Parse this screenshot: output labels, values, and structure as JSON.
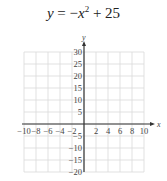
{
  "title_parts": {
    "lhs": "y",
    "eq": " = −",
    "x": "x",
    "sup": "2",
    "rest": " + 25"
  },
  "chart_data": {
    "type": "line",
    "xlabel": "x",
    "ylabel": "y",
    "xlim": [
      -10,
      10
    ],
    "ylim": [
      -20,
      30
    ],
    "grid": true,
    "xticks": [
      -10,
      -8,
      -6,
      -4,
      -2,
      2,
      4,
      6,
      8,
      10
    ],
    "yticks": [
      -20,
      -15,
      -10,
      -5,
      5,
      10,
      15,
      20,
      25,
      30
    ],
    "series": [],
    "note": "Blank coordinate grid; curve not plotted"
  },
  "colors": {
    "grid": "#d9d9d9",
    "axis": "#333333",
    "text": "#444444"
  }
}
